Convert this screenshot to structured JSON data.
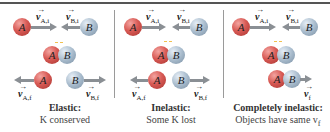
{
  "figure": {
    "colors": {
      "ball_A": "#d85a55",
      "ball_B": "#a9bccd",
      "arrow": "#8a8f94",
      "divider": "#9a9a9a",
      "top_rule": "#555555"
    },
    "panels": [
      {
        "id": "elastic",
        "title": "Elastic:",
        "subtitle": "K conserved",
        "ball_a_label": "A",
        "ball_b_label": "B",
        "initial_velocity_A": "v",
        "initial_velocity_A_sub": "A,i",
        "initial_velocity_B": "v",
        "initial_velocity_B_sub": "B,i",
        "final_velocity_A": "v",
        "final_velocity_A_sub": "A,f",
        "final_velocity_B": "v",
        "final_velocity_B_sub": "B,f"
      },
      {
        "id": "inelastic",
        "title": "Inelastic:",
        "subtitle": "Some K lost",
        "ball_a_label": "A",
        "ball_b_label": "B",
        "initial_velocity_A": "v",
        "initial_velocity_A_sub": "A,i",
        "initial_velocity_B": "v",
        "initial_velocity_B_sub": "B,i",
        "final_velocity_A": "v",
        "final_velocity_A_sub": "A,f",
        "final_velocity_B": "v",
        "final_velocity_B_sub": "B,f"
      },
      {
        "id": "completely-inelastic",
        "title": "Completely inelastic:",
        "subtitle": "Objects have same v",
        "subtitle_sub": "f",
        "ball_a_label": "A",
        "ball_b_label": "B",
        "initial_velocity_A": "v",
        "initial_velocity_A_sub": "A,i",
        "initial_velocity_B": "v",
        "initial_velocity_B_sub": "B,i",
        "final_velocity": "v",
        "final_velocity_sub": "f"
      }
    ],
    "vector_arrow_glyph": "→"
  }
}
